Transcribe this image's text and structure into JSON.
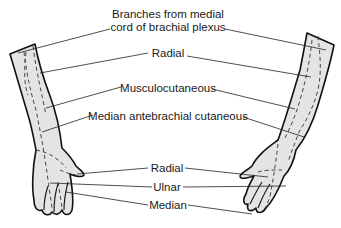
{
  "figure": {
    "type": "anatomical-diagram"
  },
  "labels": {
    "medial_cord_line1": "Branches from medial",
    "medial_cord_line2": "cord of brachial plexus",
    "radial_upper": "Radial",
    "musculocutaneous": "Musculocutaneous",
    "median_antebrachial": "Median antebrachial cutaneous",
    "radial_hand": "Radial",
    "ulnar": "Ulnar",
    "median": "Median"
  },
  "colors": {
    "skin_fill": "#e4e4e4",
    "outline": "#111111",
    "leader_line": "#222222",
    "text": "#1a1a1a"
  }
}
